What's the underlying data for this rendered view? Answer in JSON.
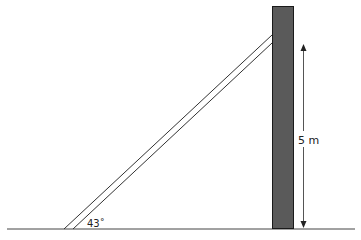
{
  "diagram": {
    "type": "ladder-against-wall",
    "angle_label": "43˚",
    "height_label": "5 m",
    "colors": {
      "wall_fill": "#5a5a5a",
      "wall_stroke": "#1a1a1a",
      "line": "#333333",
      "background": "#ffffff"
    }
  }
}
